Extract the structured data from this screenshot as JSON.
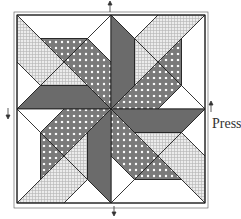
{
  "labels": {
    "press": "Press"
  },
  "colors": {
    "dark": "#6b6b6b",
    "dotted_bg": "#7a7a7a",
    "dot": "#ffffff",
    "crosshatch_bg": "#e6e6e6",
    "crosshatch_line": "#a8a8a8",
    "white": "#ffffff",
    "outline": "#1a1a1a"
  },
  "block": {
    "origin": [
      17,
      15
    ],
    "size": 188,
    "quadrant_units": 4,
    "fabrics": [
      "white",
      "crosshatch",
      "dotted",
      "dark"
    ]
  },
  "arrows": [
    {
      "position": "top-center",
      "direction": "up"
    },
    {
      "position": "left-middle",
      "direction": "down"
    },
    {
      "position": "right-middle",
      "direction": "up"
    },
    {
      "position": "bottom-center",
      "direction": "down"
    }
  ]
}
